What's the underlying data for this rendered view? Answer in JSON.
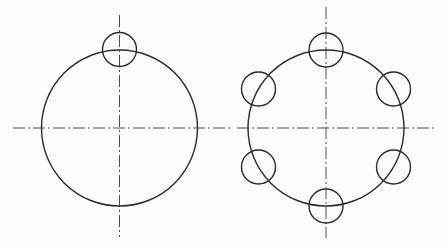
{
  "diagram": {
    "type": "technical-drawing",
    "colors": {
      "line": "#2b2b2b",
      "centerline": "#3a3a3a",
      "background": "#ffffff"
    },
    "figures": [
      {
        "id": "single-hole",
        "center": [
          119.5,
          128
        ],
        "main_circle_radius": 78,
        "small_circle_radius": 17,
        "small_circle_count": 1,
        "small_circle_centers": [
          [
            119.5,
            49.5
          ]
        ],
        "centerlines": {
          "horizontal": [
            13,
            128,
            231,
            128
          ],
          "vertical": [
            119.5,
            15,
            119.5,
            237
          ]
        }
      },
      {
        "id": "circular-array",
        "center": [
          326,
          128
        ],
        "main_circle_radius": 78,
        "small_circle_radius": 17,
        "small_circle_count": 6,
        "small_circle_centers": [
          [
            326,
            50
          ],
          [
            393.5,
            89
          ],
          [
            393.5,
            167
          ],
          [
            326,
            206
          ],
          [
            258.5,
            167
          ],
          [
            258.5,
            89
          ]
        ],
        "centerlines": {
          "horizontal": [
            237,
            128,
            437,
            128
          ],
          "vertical": [
            326,
            7,
            326,
            238
          ]
        }
      }
    ]
  }
}
